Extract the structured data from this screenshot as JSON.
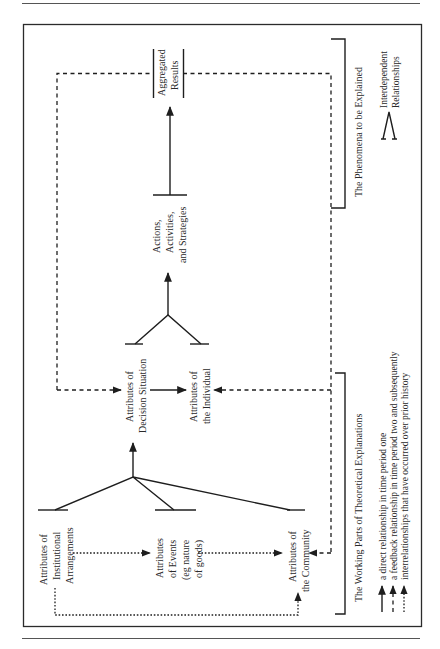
{
  "figure": {
    "nodes": {
      "aggregated_results": [
        "Aggregated",
        "Results"
      ],
      "actions": [
        "Actions,",
        "Activities,",
        "and Strategies"
      ],
      "decision_situation": [
        "Attributes of",
        "Decision Situation"
      ],
      "individual": [
        "Attributes of",
        "the Individual"
      ],
      "institutional": [
        "Attributes of",
        "Institutional",
        "Arrangements"
      ],
      "events": [
        "Attributes",
        "of Events",
        "(eg nature",
        "of goods)"
      ],
      "community": [
        "Attributes of",
        "the Community"
      ]
    },
    "brackets": {
      "phenomena": "The Phenomena to be Explained",
      "working_parts": "The Working Parts of Theoretical Explanations"
    },
    "interdependent": [
      "Interdependent",
      "Relationships"
    ],
    "legend": [
      {
        "style": "solid",
        "label": "a direct relationship in time period one"
      },
      {
        "style": "dashed",
        "label": "a feedback relationship in time period two and subsequently"
      },
      {
        "style": "dotted",
        "label": "interrelationships that have occurred over prior history"
      }
    ]
  }
}
